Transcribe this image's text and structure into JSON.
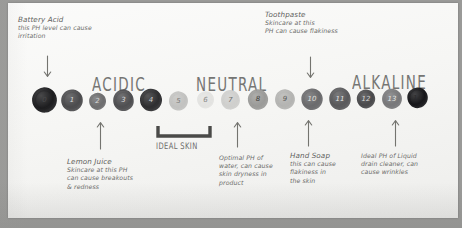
{
  "diagram": {
    "medium": "handwritten whiteboard photo"
  },
  "sections": [
    {
      "label": "ACIDIC",
      "x": 92,
      "y": 78
    },
    {
      "label": "NEUTRAL",
      "x": 196,
      "y": 78
    },
    {
      "label": "ALKALINE",
      "x": 352,
      "y": 76
    }
  ],
  "scale": {
    "ideal_bracket_label": "IDEAL SKIN",
    "blobs": [
      {
        "value": "0",
        "x": 31,
        "y": 86,
        "w": 27,
        "h": 28,
        "color": "#1d1d1f",
        "num_color": "#4a4a4c",
        "rot": -6
      },
      {
        "value": "1",
        "x": 60,
        "y": 88,
        "w": 24,
        "h": 25,
        "color": "#4b4b4d",
        "num_color": "#d8d8d8",
        "rot": 5
      },
      {
        "value": "2",
        "x": 88,
        "y": 92,
        "w": 19,
        "h": 19,
        "color": "#6e6e6f",
        "num_color": "#d9d9d9",
        "rot": -3
      },
      {
        "value": "3",
        "x": 112,
        "y": 88,
        "w": 23,
        "h": 25,
        "color": "#4f4f51",
        "num_color": "#dcdcdc",
        "rot": 7
      },
      {
        "value": "4",
        "x": 139,
        "y": 87,
        "w": 24,
        "h": 26,
        "color": "#2e2e30",
        "num_color": "#cfcfcf",
        "rot": -4
      },
      {
        "value": "5",
        "x": 168,
        "y": 90,
        "w": 21,
        "h": 22,
        "color": "#c2c2c0",
        "num_color": "#7a7a78",
        "rot": 3
      },
      {
        "value": "6",
        "x": 196,
        "y": 90,
        "w": 19,
        "h": 20,
        "color": "#e3e3e1",
        "num_color": "#8a8a88",
        "rot": -5
      },
      {
        "value": "7",
        "x": 220,
        "y": 89,
        "w": 21,
        "h": 22,
        "color": "#cfcfcd",
        "num_color": "#6e6e6c",
        "rot": 4
      },
      {
        "value": "8",
        "x": 247,
        "y": 88,
        "w": 22,
        "h": 23,
        "color": "#9b9b99",
        "num_color": "#3c3c3a",
        "rot": -4
      },
      {
        "value": "9",
        "x": 274,
        "y": 88,
        "w": 22,
        "h": 23,
        "color": "#b4b4b2",
        "num_color": "#5c5c5a",
        "rot": 5
      },
      {
        "value": "10",
        "x": 300,
        "y": 87,
        "w": 24,
        "h": 25,
        "color": "#6a6a6c",
        "num_color": "#e0e0de",
        "rot": -6
      },
      {
        "value": "11",
        "x": 328,
        "y": 86,
        "w": 24,
        "h": 26,
        "color": "#59595b",
        "num_color": "#e4e4e2",
        "rot": 4
      },
      {
        "value": "12",
        "x": 356,
        "y": 88,
        "w": 20,
        "h": 22,
        "color": "#4a4a4c",
        "num_color": "#d6d6d4",
        "rot": -3
      },
      {
        "value": "13",
        "x": 381,
        "y": 87,
        "w": 22,
        "h": 24,
        "color": "#78787a",
        "num_color": "#e6e6e4",
        "rot": 6
      },
      {
        "value": "14",
        "x": 406,
        "y": 85,
        "w": 23,
        "h": 26,
        "color": "#17171a",
        "num_color": "#2a2a2c",
        "rot": -5
      }
    ]
  },
  "notes": [
    {
      "id": "battery-acid",
      "title": "Battery Acid",
      "body": "this PH level can cause\nirritation",
      "x": 18,
      "y": 16,
      "w": 130,
      "arrow": {
        "direction": "down",
        "x": 42,
        "y": 55,
        "len": 22
      }
    },
    {
      "id": "toothpaste",
      "title": "Toothpaste",
      "body": "Skincare at this\nPH can cause flakiness",
      "x": 265,
      "y": 11,
      "w": 115,
      "arrow": {
        "direction": "down",
        "x": 305,
        "y": 56,
        "len": 22
      }
    },
    {
      "id": "lemon-juice",
      "title": "Lemon Juice",
      "body": "Skincare at this PH\ncan cause breakouts\n& redness",
      "x": 67,
      "y": 158,
      "w": 105,
      "arrow": {
        "direction": "up",
        "x": 95,
        "y": 122,
        "len": 28
      }
    },
    {
      "id": "water",
      "title": "",
      "body": "Optimal PH of\nwater, can cause\nskin dryness in\nproduct",
      "x": 219,
      "y": 154,
      "w": 75,
      "arrow": {
        "direction": "up",
        "x": 232,
        "y": 122,
        "len": 26
      }
    },
    {
      "id": "hand-soap",
      "title": "Hand Soap",
      "body": "this can cause\nflakiness in\nthe skin",
      "x": 290,
      "y": 152,
      "w": 80,
      "arrow": {
        "direction": "up",
        "x": 303,
        "y": 120,
        "len": 27
      }
    },
    {
      "id": "drain-cleaner",
      "title": "",
      "body": "Ideal PH of Liquid\ndrain cleaner, can\ncause wrinkles",
      "x": 361,
      "y": 152,
      "w": 95,
      "arrow": {
        "direction": "up",
        "x": 390,
        "y": 120,
        "len": 27
      }
    }
  ],
  "colors": {
    "board": "#9a9a98",
    "sheet": "#fbfbfa",
    "ink": "#6d6d6b"
  }
}
